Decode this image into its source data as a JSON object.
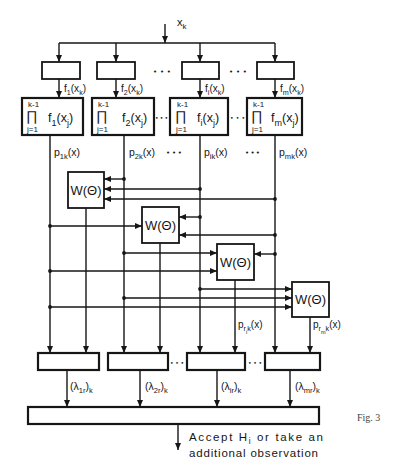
{
  "figure": {
    "caption": "Fig. 3",
    "ellipsis_wide": "• • •",
    "ellipsis_tight": "•••"
  },
  "input": {
    "label": [
      {
        "t": "x"
      },
      {
        "t": "k",
        "s": "sub"
      }
    ]
  },
  "columns": [
    {
      "density_output": [
        {
          "t": "f"
        },
        {
          "t": "1",
          "s": "sub"
        },
        {
          "t": "(x"
        },
        {
          "t": "k",
          "s": "sub"
        },
        {
          "t": ")"
        }
      ],
      "product": {
        "upper": "k-1",
        "operator": "∏",
        "lower": "j=1",
        "term": [
          {
            "t": "f"
          },
          {
            "t": "1",
            "s": "sub"
          },
          {
            "t": "(x"
          },
          {
            "t": "j",
            "s": "sub"
          },
          {
            "t": ")"
          }
        ]
      },
      "posterior": [
        {
          "t": "p"
        },
        {
          "t": "1k",
          "s": "sub"
        },
        {
          "t": "(x)"
        }
      ],
      "likelihood_ratio": [
        {
          "t": "(λ"
        },
        {
          "t": "1r",
          "s": "sub"
        },
        {
          "t": ")"
        },
        {
          "t": "k",
          "s": "sub"
        }
      ]
    },
    {
      "density_output": [
        {
          "t": "f"
        },
        {
          "t": "2",
          "s": "sub"
        },
        {
          "t": "(x"
        },
        {
          "t": "k",
          "s": "sub"
        },
        {
          "t": ")"
        }
      ],
      "product": {
        "upper": "k-1",
        "operator": "∏",
        "lower": "j=1",
        "term": [
          {
            "t": "f"
          },
          {
            "t": "2",
            "s": "sub"
          },
          {
            "t": "(x"
          },
          {
            "t": "j",
            "s": "sub"
          },
          {
            "t": ")"
          }
        ]
      },
      "posterior": [
        {
          "t": "p"
        },
        {
          "t": "2k",
          "s": "sub"
        },
        {
          "t": "(x)"
        }
      ],
      "likelihood_ratio": [
        {
          "t": "(λ"
        },
        {
          "t": "2r",
          "s": "sub"
        },
        {
          "t": ")"
        },
        {
          "t": "k",
          "s": "sub"
        }
      ]
    },
    {
      "density_output": [
        {
          "t": "f"
        },
        {
          "t": "i",
          "s": "sub"
        },
        {
          "t": "(x"
        },
        {
          "t": "k",
          "s": "sub"
        },
        {
          "t": ")"
        }
      ],
      "product": {
        "upper": "k-1",
        "operator": "∏",
        "lower": "j=1",
        "term": [
          {
            "t": "f"
          },
          {
            "t": "i",
            "s": "sub"
          },
          {
            "t": "(x"
          },
          {
            "t": "j",
            "s": "sub"
          },
          {
            "t": ")"
          }
        ]
      },
      "posterior": [
        {
          "t": "p"
        },
        {
          "t": "ik",
          "s": "sub"
        },
        {
          "t": "(x)"
        }
      ],
      "likelihood_ratio": [
        {
          "t": "(λ"
        },
        {
          "t": "ir",
          "s": "sub"
        },
        {
          "t": ")"
        },
        {
          "t": "k",
          "s": "sub"
        }
      ]
    },
    {
      "density_output": [
        {
          "t": "f"
        },
        {
          "t": "m",
          "s": "sub"
        },
        {
          "t": "(x"
        },
        {
          "t": "k",
          "s": "sub"
        },
        {
          "t": ")"
        }
      ],
      "product": {
        "upper": "k-1",
        "operator": "∏",
        "lower": "j=1",
        "term": [
          {
            "t": "f"
          },
          {
            "t": "m",
            "s": "sub"
          },
          {
            "t": "(x"
          },
          {
            "t": "j",
            "s": "sub"
          },
          {
            "t": ")"
          }
        ]
      },
      "posterior": [
        {
          "t": "p"
        },
        {
          "t": "mk",
          "s": "sub"
        },
        {
          "t": "(x)"
        }
      ],
      "likelihood_ratio": [
        {
          "t": "(λ"
        },
        {
          "t": "mr",
          "s": "sub"
        },
        {
          "t": ")"
        },
        {
          "t": "k",
          "s": "sub"
        }
      ]
    }
  ],
  "weight_blocks": [
    {
      "label": "W(Θ)"
    },
    {
      "label": "W(Θ)"
    },
    {
      "label": "W(Θ)",
      "output_label": [
        {
          "t": "p"
        },
        {
          "t": "r",
          "s": "sub"
        },
        {
          "t": "i",
          "s": "sub2"
        },
        {
          "t": "k",
          "s": "sub"
        },
        {
          "t": "(x)"
        }
      ]
    },
    {
      "label": "W(Θ)",
      "output_label": [
        {
          "t": "p"
        },
        {
          "t": "r",
          "s": "sub"
        },
        {
          "t": "m",
          "s": "sub2"
        },
        {
          "t": "k",
          "s": "sub"
        },
        {
          "t": "(x)"
        }
      ]
    }
  ],
  "decision": {
    "output_line1": [
      {
        "t": "Accept H"
      },
      {
        "t": "i",
        "s": "sub"
      },
      {
        "t": " or take an"
      }
    ],
    "output_line2": "additional observation"
  }
}
